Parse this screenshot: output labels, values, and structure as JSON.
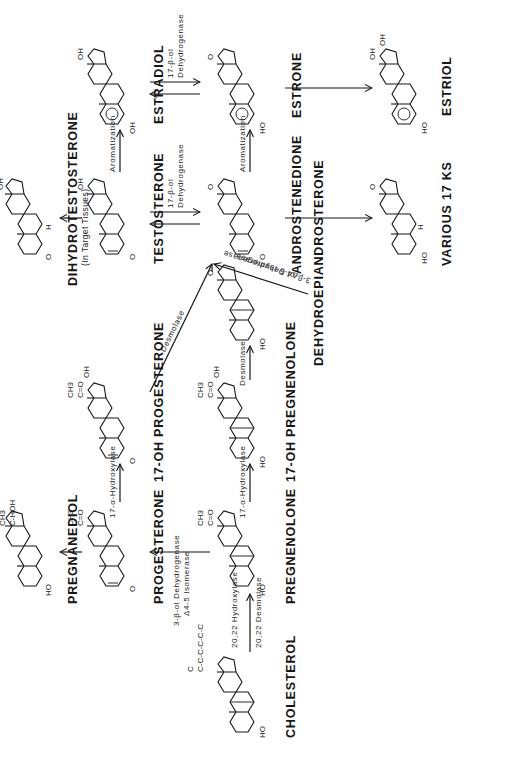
{
  "orientation": "rotated 90° counter-clockwise",
  "compounds": {
    "cholesterol": {
      "label": "CHOLESTEROL",
      "groups": [
        "C",
        "C-C-C-C-C-C",
        "HO"
      ]
    },
    "pregnenolone": {
      "label": "PREGNENOLONE",
      "groups": [
        "CH3",
        "C=O",
        "HO"
      ]
    },
    "progesterone": {
      "label": "PROGESTERONE",
      "groups": [
        "CH3",
        "C=O",
        "O"
      ]
    },
    "pregnanediol": {
      "label": "PREGNANEDIOL",
      "groups": [
        "CH3",
        "C-HOH",
        "HO"
      ]
    },
    "oh17_pregnenolone": {
      "label": "17-OH PREGNENOLONE",
      "groups": [
        "CH3",
        "C=O",
        "OH",
        "HO"
      ]
    },
    "oh17_progesterone": {
      "label": "17-OH PROGESTERONE",
      "groups": [
        "CH3",
        "C=O",
        "OH",
        "O"
      ]
    },
    "dhea": {
      "label": "DEHYDROEPIANDROSTERONE",
      "groups": [
        "O",
        "HO"
      ]
    },
    "androstenedione": {
      "label": "ANDROSTENEDIONE",
      "groups": [
        "O",
        "O"
      ]
    },
    "testosterone": {
      "label": "TESTOSTERONE",
      "groups": [
        "OH",
        "O"
      ]
    },
    "dht": {
      "label": "DIHYDROTESTOSTERONE",
      "sublabel": "(In Target Tissues)",
      "groups": [
        "OH",
        "H",
        "O"
      ]
    },
    "various17ks": {
      "label": "VARIOUS 17 KS",
      "groups": [
        "O",
        "H",
        "HO"
      ]
    },
    "estrone": {
      "label": "ESTRONE",
      "groups": [
        "O",
        "HO"
      ]
    },
    "estradiol": {
      "label": "ESTRADIOL",
      "groups": [
        "OH",
        "OH"
      ]
    },
    "estriol": {
      "label": "ESTRIOL",
      "groups": [
        "OH",
        "OH",
        "HO"
      ]
    }
  },
  "enzymes": {
    "cholesterol_to_pregnenolone": [
      "20,22 Hydroxylase",
      "20,22 Desmolase"
    ],
    "pregnenolone_to_progesterone": [
      "3-β-ol Dehydrogenase",
      "Δ4-5 Isomerase"
    ],
    "pregnenolone_to_17oh_preg": "17-α-Hydroxylase",
    "progesterone_to_17oh_prog": "17-α-Hydroxylase",
    "oh17preg_to_dhea": "Desmolase",
    "oh17prog_to_andro": "Desmolase",
    "dhea_to_andro": [
      "Δ4-5 Isomerase",
      "3-β-ol Dehydrogenase"
    ],
    "andro_testo": [
      "17-β-ol",
      "Dehydrogenase"
    ],
    "estrone_estradiol": [
      "17-β-ol",
      "Dehydrogenase"
    ],
    "testo_to_estradiol": "Aromatization",
    "andro_to_estrone": "Aromatization"
  },
  "colors": {
    "ink": "#161616",
    "background": "#ffffff"
  }
}
